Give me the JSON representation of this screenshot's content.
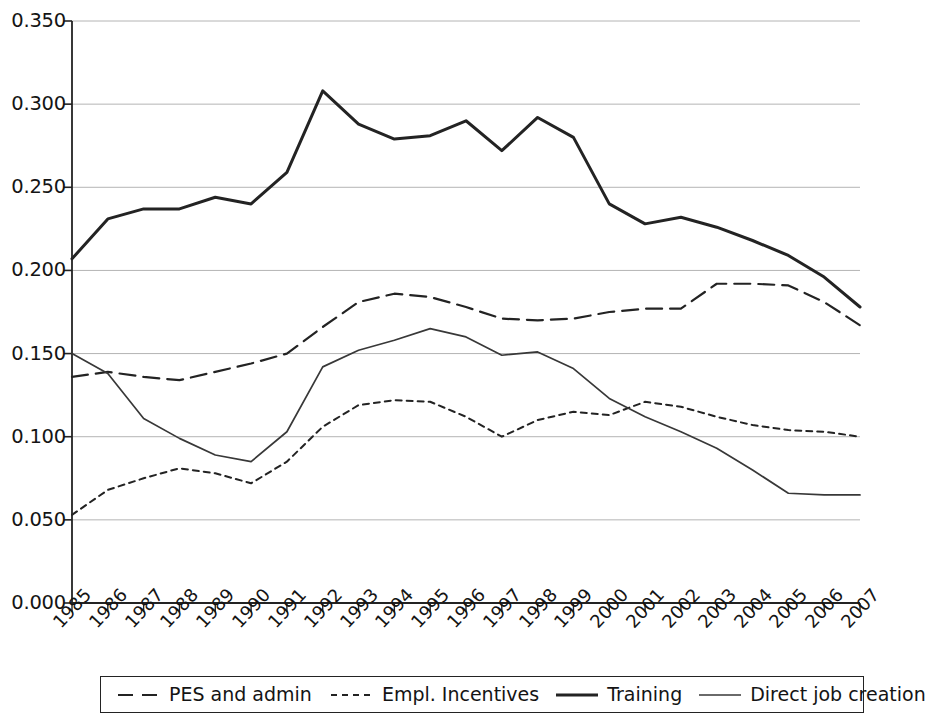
{
  "chart_data": {
    "type": "line",
    "title": "",
    "subtitle": "",
    "xlabel": "",
    "ylabel": "",
    "grid": true,
    "legend_position": "bottom",
    "xlim": [
      1985,
      2007
    ],
    "ylim": [
      0.0,
      0.35
    ],
    "ytick_labels": [
      "0.000",
      "0.050",
      "0.100",
      "0.150",
      "0.200",
      "0.250",
      "0.300",
      "0.350"
    ],
    "ytick_values": [
      0.0,
      0.05,
      0.1,
      0.15,
      0.2,
      0.25,
      0.3,
      0.35
    ],
    "categories": [
      "1985",
      "1986",
      "1987",
      "1988",
      "1989",
      "1990",
      "1991",
      "1992",
      "1993",
      "1994",
      "1995",
      "1996",
      "1997",
      "1998",
      "1999",
      "2000",
      "2001",
      "2002",
      "2003",
      "2004",
      "2005",
      "2006",
      "2007"
    ],
    "series": [
      {
        "name": "PES and admin",
        "style": "dashed",
        "color": "#232323",
        "width": 2.2,
        "values": [
          0.136,
          0.139,
          0.136,
          0.134,
          0.139,
          0.144,
          0.15,
          0.166,
          0.181,
          0.186,
          0.184,
          0.178,
          0.171,
          0.17,
          0.171,
          0.175,
          0.177,
          0.177,
          0.192,
          0.192,
          0.191,
          0.181,
          0.167
        ]
      },
      {
        "name": "Empl. Incentives",
        "style": "dotted",
        "color": "#232323",
        "width": 2.0,
        "values": [
          0.053,
          0.068,
          0.075,
          0.081,
          0.078,
          0.072,
          0.085,
          0.106,
          0.119,
          0.122,
          0.121,
          0.112,
          0.1,
          0.11,
          0.115,
          0.113,
          0.121,
          0.118,
          0.112,
          0.107,
          0.104,
          0.103,
          0.1
        ]
      },
      {
        "name": "Training",
        "style": "solid-thick",
        "color": "#232323",
        "width": 3.0,
        "values": [
          0.207,
          0.231,
          0.237,
          0.237,
          0.244,
          0.24,
          0.259,
          0.308,
          0.288,
          0.279,
          0.281,
          0.29,
          0.272,
          0.292,
          0.28,
          0.24,
          0.228,
          0.232,
          0.226,
          0.218,
          0.209,
          0.196,
          0.178
        ]
      },
      {
        "name": "Direct job creation",
        "style": "solid-thin",
        "color": "#383838",
        "width": 1.7,
        "values": [
          0.15,
          0.138,
          0.111,
          0.099,
          0.089,
          0.085,
          0.103,
          0.142,
          0.152,
          0.158,
          0.165,
          0.16,
          0.149,
          0.151,
          0.141,
          0.123,
          0.112,
          0.103,
          0.093,
          0.08,
          0.066,
          0.065,
          0.065
        ]
      }
    ]
  },
  "legend": {
    "items": [
      {
        "label": "PES and admin",
        "style": "dashed"
      },
      {
        "label": "Empl. Incentives",
        "style": "dotted"
      },
      {
        "label": "Training",
        "style": "solid-thick"
      },
      {
        "label": "Direct job creation",
        "style": "solid-thin"
      }
    ]
  }
}
